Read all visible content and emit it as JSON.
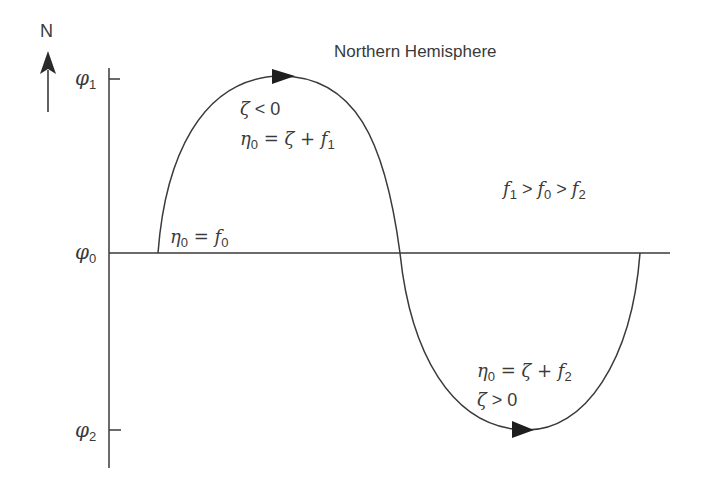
{
  "title": "Northern Hemisphere",
  "compass": {
    "label": "N",
    "icon": "north-arrow-icon"
  },
  "axis": {
    "labels": {
      "phi1": {
        "sym": "φ",
        "sub": "1"
      },
      "phi0": {
        "sym": "φ",
        "sub": "0"
      },
      "phi2": {
        "sym": "φ",
        "sub": "2"
      }
    }
  },
  "annotations": {
    "ridge_zeta": {
      "lhs": "ζ",
      "op": " < ",
      "rhs": "0"
    },
    "ridge_eta": {
      "lhs": "η",
      "lhs_sub": "0",
      "eq": " = ζ + ",
      "f": "f",
      "f_sub": "1"
    },
    "start_eta": {
      "lhs": "η",
      "lhs_sub": "0",
      "eq": " = ",
      "f": "f",
      "f_sub": "0"
    },
    "inequality": {
      "f1": "f",
      "s1": "1",
      "op1": " > ",
      "f0": "f",
      "s0": "0",
      "op2": " > ",
      "f2": "f",
      "s2": "2"
    },
    "trough_eta": {
      "lhs": "η",
      "lhs_sub": "0",
      "eq": " = ζ + ",
      "f": "f",
      "f_sub": "2"
    },
    "trough_zeta": {
      "lhs": "ζ",
      "op": " > ",
      "rhs": "0"
    }
  },
  "colors": {
    "line": "#3a3a3a",
    "text": "#3a3a3a",
    "background": "#ffffff"
  }
}
